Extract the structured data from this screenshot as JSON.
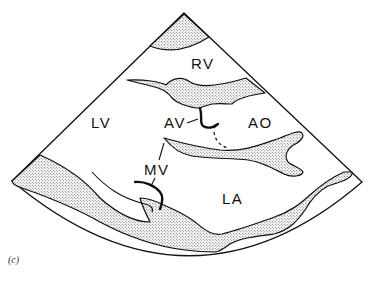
{
  "figure": {
    "view": "parasternal long-axis echocardiogram schematic",
    "caption_label": "(c)",
    "colors": {
      "line": "#111111",
      "stipple": "#555555",
      "background": "#ffffff"
    },
    "labels": {
      "rv": "RV",
      "lv": "LV",
      "av": "AV",
      "ao": "AO",
      "mv": "MV",
      "la": "LA"
    },
    "structures": [
      "anterior chest wall / RV free wall",
      "interventricular septum",
      "aortic valve",
      "aortic root",
      "anterior mitral leaflet",
      "posterior mitral leaflet",
      "posterior LV wall",
      "left atrial posterior wall"
    ]
  }
}
